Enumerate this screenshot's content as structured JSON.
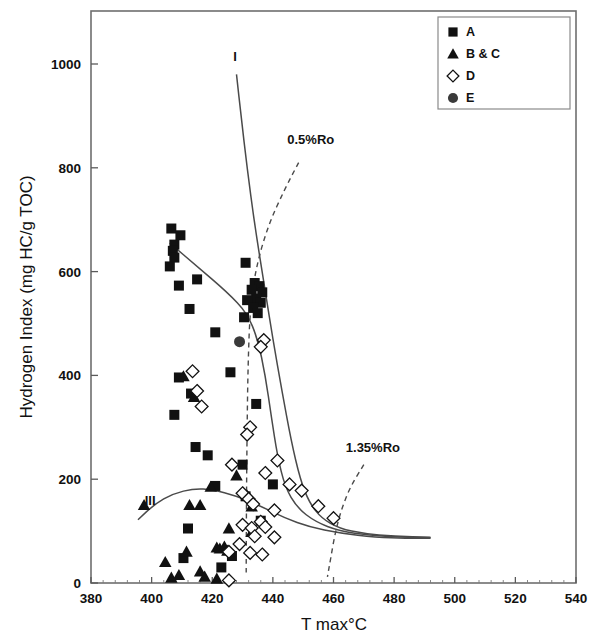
{
  "chart_data": {
    "type": "scatter",
    "title": "",
    "xlabel": "T max°C",
    "ylabel": "Hydrogen Index (mg HC/g TOC)",
    "xlim": [
      380,
      540
    ],
    "ylim": [
      0,
      1080
    ],
    "xticks": [
      380,
      400,
      420,
      440,
      460,
      480,
      500,
      520,
      540
    ],
    "yticks": [
      0,
      200,
      400,
      600,
      800,
      1000
    ],
    "xtick_labels": [
      "380",
      "400",
      "420",
      "440",
      "460",
      "480",
      "500",
      "520",
      "540"
    ],
    "ytick_labels": [
      "0",
      "200",
      "400",
      "600",
      "800",
      "1000"
    ],
    "grid": false,
    "legend_position": "top-right",
    "legend": [
      {
        "label": "A",
        "marker": "filled-square"
      },
      {
        "label": "B & C",
        "marker": "filled-triangle"
      },
      {
        "label": "D",
        "marker": "open-diamond"
      },
      {
        "label": "E",
        "marker": "filled-circle"
      }
    ],
    "annotations": [
      {
        "text": "I",
        "x": 427.5,
        "y": 1005
      },
      {
        "text": "0.5%Ro",
        "x": 452.5,
        "y": 845
      },
      {
        "text": "1.35%Ro",
        "x": 473,
        "y": 253
      },
      {
        "text": "III",
        "x": 399.5,
        "y": 150
      }
    ],
    "series": [
      {
        "name": "A",
        "marker": "filled-square",
        "points": [
          [
            406.5,
            683
          ],
          [
            409.5,
            670
          ],
          [
            407.5,
            652
          ],
          [
            407.0,
            640
          ],
          [
            407.5,
            627
          ],
          [
            406.0,
            610
          ],
          [
            409.0,
            573
          ],
          [
            415.0,
            585
          ],
          [
            412.5,
            528
          ],
          [
            421.0,
            483
          ],
          [
            431.0,
            617
          ],
          [
            434.0,
            578
          ],
          [
            435.5,
            572
          ],
          [
            433.0,
            565
          ],
          [
            436.5,
            560
          ],
          [
            434.5,
            548
          ],
          [
            431.5,
            545
          ],
          [
            436.0,
            540
          ],
          [
            433.5,
            530
          ],
          [
            435.0,
            520
          ],
          [
            430.5,
            512
          ],
          [
            426.0,
            406
          ],
          [
            409.0,
            396
          ],
          [
            413.0,
            365
          ],
          [
            407.5,
            324
          ],
          [
            434.5,
            345
          ],
          [
            414.5,
            262
          ],
          [
            418.5,
            246
          ],
          [
            430.0,
            228
          ],
          [
            440.0,
            190
          ],
          [
            421.0,
            187
          ],
          [
            431.0,
            167
          ],
          [
            412.0,
            105
          ],
          [
            436.0,
            120
          ],
          [
            410.5,
            48
          ],
          [
            423.0,
            30
          ],
          [
            426.5,
            52
          ]
        ]
      },
      {
        "name": "B & C",
        "marker": "filled-triangle",
        "points": [
          [
            410.5,
            398
          ],
          [
            414.0,
            358
          ],
          [
            397.5,
            150
          ],
          [
            412.5,
            150
          ],
          [
            416.0,
            150
          ],
          [
            419.5,
            185
          ],
          [
            428.0,
            207
          ],
          [
            431.5,
            168
          ],
          [
            433.0,
            147
          ],
          [
            425.5,
            105
          ],
          [
            421.5,
            68
          ],
          [
            422.5,
            66
          ],
          [
            424.0,
            70
          ],
          [
            425.0,
            62
          ],
          [
            411.5,
            60
          ],
          [
            416.0,
            22
          ],
          [
            404.5,
            40
          ],
          [
            409.0,
            15
          ],
          [
            417.5,
            12
          ],
          [
            421.5,
            8
          ],
          [
            406.5,
            10
          ],
          [
            433.0,
            98
          ]
        ]
      },
      {
        "name": "D",
        "marker": "open-diamond",
        "points": [
          [
            437.0,
            468
          ],
          [
            436.0,
            455
          ],
          [
            413.5,
            408
          ],
          [
            415.0,
            370
          ],
          [
            416.5,
            340
          ],
          [
            432.5,
            300
          ],
          [
            431.5,
            286
          ],
          [
            441.5,
            236
          ],
          [
            426.5,
            228
          ],
          [
            437.5,
            212
          ],
          [
            445.5,
            190
          ],
          [
            449.5,
            178
          ],
          [
            430.0,
            173
          ],
          [
            432.0,
            162
          ],
          [
            433.5,
            152
          ],
          [
            440.5,
            140
          ],
          [
            455.0,
            148
          ],
          [
            460.0,
            125
          ],
          [
            436.0,
            118
          ],
          [
            430.0,
            112
          ],
          [
            433.0,
            106
          ],
          [
            437.5,
            108
          ],
          [
            434.0,
            90
          ],
          [
            429.0,
            75
          ],
          [
            425.5,
            60
          ],
          [
            436.5,
            55
          ],
          [
            425.5,
            5
          ],
          [
            440.5,
            88
          ],
          [
            432.5,
            58
          ]
        ]
      },
      {
        "name": "E",
        "marker": "filled-circle",
        "points": [
          [
            429.0,
            465
          ]
        ]
      }
    ],
    "curves": [
      {
        "name": "type-I-maturity-path",
        "style": "solid",
        "points": [
          [
            428.0,
            980
          ],
          [
            429.5,
            900
          ],
          [
            431.5,
            800
          ],
          [
            434.0,
            690
          ],
          [
            437.0,
            580
          ],
          [
            440.0,
            470
          ],
          [
            443.0,
            370
          ],
          [
            446.0,
            275
          ],
          [
            449.0,
            200
          ],
          [
            452.0,
            155
          ],
          [
            456.0,
            125
          ],
          [
            462.0,
            105
          ],
          [
            470.0,
            95
          ],
          [
            480.0,
            90
          ],
          [
            492.0,
            88
          ]
        ]
      },
      {
        "name": "type-II-maturity-path",
        "style": "solid",
        "points": [
          [
            406.0,
            655
          ],
          [
            415.0,
            610
          ],
          [
            425.0,
            560
          ],
          [
            431.5,
            520
          ],
          [
            435.0,
            470
          ],
          [
            437.5,
            400
          ],
          [
            439.5,
            320
          ],
          [
            441.5,
            245
          ],
          [
            444.0,
            185
          ],
          [
            448.0,
            145
          ],
          [
            454.0,
            118
          ],
          [
            462.0,
            100
          ],
          [
            472.0,
            92
          ],
          [
            482.0,
            88
          ],
          [
            492.0,
            87
          ]
        ]
      },
      {
        "name": "type-III-maturity-path",
        "style": "solid",
        "points": [
          [
            395.5,
            122
          ],
          [
            401.0,
            152
          ],
          [
            407.0,
            172
          ],
          [
            414.0,
            182
          ],
          [
            420.0,
            180
          ],
          [
            428.0,
            168
          ],
          [
            436.0,
            148
          ],
          [
            444.0,
            125
          ],
          [
            452.0,
            108
          ],
          [
            462.0,
            96
          ],
          [
            474.0,
            88
          ],
          [
            484.0,
            86
          ],
          [
            492.0,
            86
          ]
        ]
      }
    ],
    "ro_lines": [
      {
        "name": "0.5%Ro",
        "style": "dashed",
        "points": [
          [
            448.5,
            810
          ],
          [
            444.0,
            760
          ],
          [
            438.5,
            690
          ],
          [
            434.5,
            610
          ],
          [
            432.5,
            530
          ],
          [
            431.8,
            420
          ],
          [
            431.5,
            300
          ],
          [
            431.3,
            170
          ],
          [
            431.2,
            40
          ],
          [
            431.2,
            15
          ]
        ]
      },
      {
        "name": "1.35%Ro",
        "style": "dashed",
        "points": [
          [
            470.0,
            228
          ],
          [
            465.5,
            185
          ],
          [
            462.5,
            140
          ],
          [
            460.5,
            95
          ],
          [
            459.0,
            45
          ],
          [
            458.0,
            12
          ]
        ]
      }
    ]
  }
}
